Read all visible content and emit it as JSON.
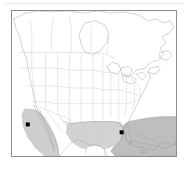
{
  "figure": {
    "kind": "distribution-map",
    "region": "North America",
    "background_color": "#ffffff",
    "frame": {
      "border_color": "#8c8c8c",
      "x": 11,
      "y": 10,
      "width": 166,
      "height": 147
    }
  },
  "legend_colors": {
    "land_fill": "#ffffff",
    "coastline_stroke": "#9a9a9a",
    "internal_border_stroke": "#c4c4c4",
    "range_shade_light": "#cfcfcf",
    "range_shade_dark": "#bdbdbd",
    "locality_dot": "#000000"
  },
  "map_layers": {
    "coastlines_label": "North America coastline",
    "country_borders_label": "Country borders",
    "state_borders_label": "US state and Canadian province borders",
    "great_lakes_label": "Great Lakes",
    "hudson_bay_label": "Hudson Bay"
  },
  "range_polygons": [
    {
      "name": "pacific-coast-range",
      "label": "Shaded range — Pacific coast of Mexico / Baja California",
      "fill": "#cfcfcf",
      "stroke": "#b4b4b4"
    },
    {
      "name": "gulf-of-mexico-range",
      "label": "Shaded range — Gulf of Mexico",
      "fill": "#d2d2d2",
      "stroke": "#bcbcbc"
    },
    {
      "name": "caribbean-atlantic-range",
      "label": "Shaded range — Caribbean Sea and western Atlantic",
      "fill": "#bdbdbd",
      "stroke": "#a8a8a8"
    }
  ],
  "locality_points": [
    {
      "name": "locality-point-west",
      "label": "Locality record — northwestern Mexico coast",
      "x": 27,
      "y": 125,
      "size": 4,
      "color": "#000000"
    },
    {
      "name": "locality-point-east",
      "label": "Locality record — southern Florida",
      "x": 122,
      "y": 133,
      "size": 4,
      "color": "#000000"
    }
  ]
}
